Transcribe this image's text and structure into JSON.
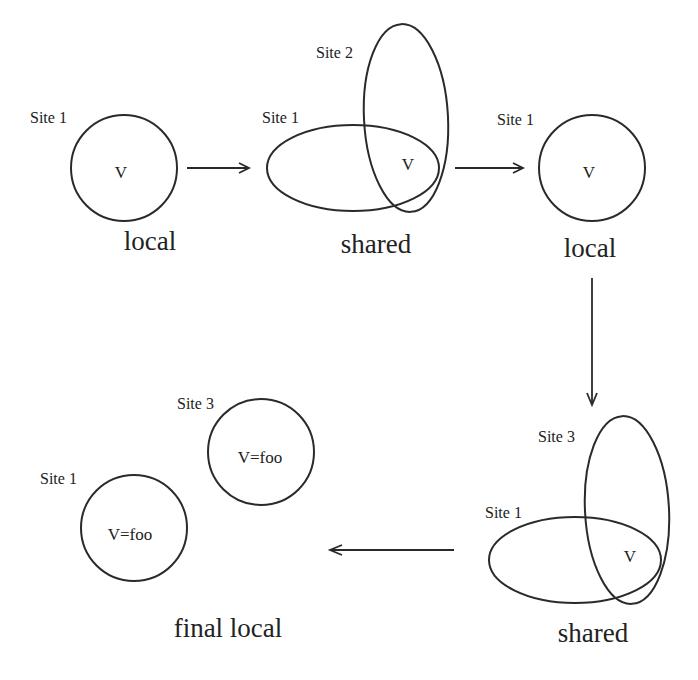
{
  "diagram": {
    "stage1": {
      "site_label": "Site 1",
      "variable": "V",
      "caption": "local"
    },
    "stage2": {
      "site_a_label": "Site 1",
      "site_b_label": "Site 2",
      "variable": "V",
      "caption": "shared"
    },
    "stage3": {
      "site_label": "Site 1",
      "variable": "V",
      "caption": "local"
    },
    "stage4": {
      "site_a_label": "Site 1",
      "site_b_label": "Site 3",
      "variable": "V",
      "caption": "shared"
    },
    "stage5": {
      "site_a_label": "Site 1",
      "site_a_value": "V=foo",
      "site_b_label": "Site 3",
      "site_b_value": "V=foo",
      "caption": "final local"
    },
    "arrows": [
      {
        "from": "stage1",
        "to": "stage2",
        "direction": "right"
      },
      {
        "from": "stage2",
        "to": "stage3",
        "direction": "right"
      },
      {
        "from": "stage3",
        "to": "stage4",
        "direction": "down"
      },
      {
        "from": "stage4",
        "to": "stage5",
        "direction": "left"
      }
    ],
    "colors": {
      "stroke": "#2a2a2a",
      "text": "#222222",
      "background": "#ffffff"
    }
  }
}
